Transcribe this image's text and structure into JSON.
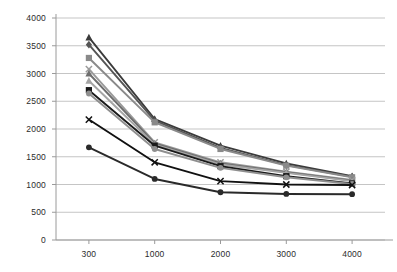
{
  "chart_data": {
    "type": "line",
    "title": "",
    "subtitle": "",
    "xlabel": "",
    "ylabel": "",
    "categories": [
      "300",
      "1000",
      "2000",
      "3000",
      "4000"
    ],
    "ylim": [
      0,
      4000
    ],
    "yticks": [
      0,
      500,
      1000,
      1500,
      2000,
      2500,
      3000,
      3500,
      4000
    ],
    "ytick_labels": [
      "0",
      "500",
      "1000",
      "1500",
      "2000",
      "2500",
      "3000",
      "3500",
      "4000"
    ],
    "xtick_labels": [
      "300",
      "1000",
      "2000",
      "3000",
      "4000"
    ],
    "grid": "horizontal",
    "legend": "none",
    "series": [
      {
        "name": "series-1",
        "marker": "triangle",
        "color": "#3b3b3b",
        "values": [
          3650,
          2180,
          1700,
          1380,
          1150
        ]
      },
      {
        "name": "series-2",
        "marker": "diamond",
        "color": "#555555",
        "values": [
          3520,
          2150,
          1660,
          1350,
          1140
        ]
      },
      {
        "name": "series-3",
        "marker": "square",
        "color": "#8a8a8a",
        "values": [
          3280,
          2120,
          1640,
          1340,
          1130
        ]
      },
      {
        "name": "series-4",
        "marker": "cross",
        "color": "#9a9a9a",
        "values": [
          3080,
          1760,
          1400,
          1230,
          1080
        ]
      },
      {
        "name": "series-5",
        "marker": "triangle",
        "color": "#6e6e6e",
        "values": [
          3000,
          1740,
          1380,
          1220,
          1070
        ]
      },
      {
        "name": "series-6",
        "marker": "triangle",
        "color": "#a5a5a5",
        "values": [
          2870,
          1720,
          1360,
          1210,
          1060
        ]
      },
      {
        "name": "series-7",
        "marker": "square",
        "color": "#1a1a1a",
        "values": [
          2700,
          1700,
          1330,
          1150,
          1020
        ]
      },
      {
        "name": "series-8",
        "marker": "circle",
        "color": "#8f8f8f",
        "values": [
          2640,
          1640,
          1300,
          1130,
          1010
        ]
      },
      {
        "name": "series-9",
        "marker": "cross",
        "color": "#111111",
        "values": [
          2170,
          1400,
          1060,
          1000,
          990
        ]
      },
      {
        "name": "series-10",
        "marker": "circle",
        "color": "#2a2a2a",
        "values": [
          1670,
          1100,
          860,
          830,
          825
        ]
      }
    ],
    "axis_color": "#9a9a9a",
    "grid_color": "#b6b6b6"
  }
}
